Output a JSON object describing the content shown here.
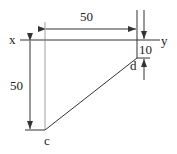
{
  "diagram": {
    "axis_labels": {
      "left": "x",
      "right": "y"
    },
    "points": {
      "c": "c",
      "d": "d"
    },
    "dimensions": {
      "top_horizontal": "50",
      "left_vertical": "50",
      "right_offset": "10"
    },
    "colors": {
      "line": "#333333",
      "background": "#ffffff"
    }
  }
}
